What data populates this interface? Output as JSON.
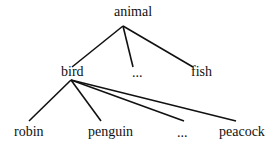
{
  "diagram": {
    "type": "tree",
    "nodes": [
      {
        "id": "animal",
        "label": "animal",
        "x": 114,
        "y": 5
      },
      {
        "id": "bird",
        "label": "bird",
        "x": 61,
        "y": 65
      },
      {
        "id": "ellipsis1",
        "label": "...",
        "x": 132,
        "y": 66
      },
      {
        "id": "fish",
        "label": "fish",
        "x": 191,
        "y": 65
      },
      {
        "id": "robin",
        "label": "robin",
        "x": 14,
        "y": 125
      },
      {
        "id": "penguin",
        "label": "penguin",
        "x": 88,
        "y": 125
      },
      {
        "id": "ellipsis2",
        "label": "...",
        "x": 177,
        "y": 126
      },
      {
        "id": "peacock",
        "label": "peacock",
        "x": 219,
        "y": 125
      }
    ],
    "edges": [
      {
        "from": "animal",
        "to": "bird",
        "x1": 123,
        "y1": 26,
        "x2": 72,
        "y2": 67
      },
      {
        "from": "animal",
        "to": "ellipsis1",
        "x1": 123,
        "y1": 26,
        "x2": 133,
        "y2": 67
      },
      {
        "from": "animal",
        "to": "fish",
        "x1": 123,
        "y1": 26,
        "x2": 193,
        "y2": 67
      },
      {
        "from": "bird",
        "to": "robin",
        "x1": 71,
        "y1": 80,
        "x2": 29,
        "y2": 121
      },
      {
        "from": "bird",
        "to": "penguin",
        "x1": 71,
        "y1": 80,
        "x2": 101,
        "y2": 121
      },
      {
        "from": "bird",
        "to": "ellipsis2",
        "x1": 71,
        "y1": 80,
        "x2": 184,
        "y2": 121
      },
      {
        "from": "bird",
        "to": "peacock",
        "x1": 71,
        "y1": 80,
        "x2": 236,
        "y2": 121
      }
    ],
    "line_color": "#111111"
  }
}
